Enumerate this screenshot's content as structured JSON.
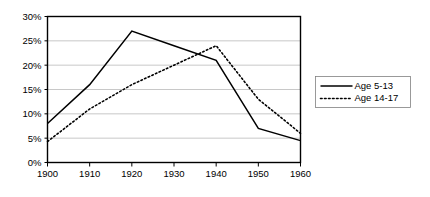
{
  "chart_data": {
    "type": "line",
    "title": "",
    "xlabel": "",
    "ylabel": "",
    "x": [
      1900,
      1910,
      1920,
      1930,
      1940,
      1950,
      1960
    ],
    "categories": [
      "1900",
      "1910",
      "1920",
      "1930",
      "1940",
      "1950",
      "1960"
    ],
    "series": [
      {
        "name": "Age 5-13",
        "style": "solid",
        "color": "#000000",
        "values": [
          8,
          16,
          27,
          24,
          21,
          7,
          4.5
        ]
      },
      {
        "name": "Age 14-17",
        "style": "dotted",
        "color": "#000000",
        "values": [
          4.3,
          11,
          16,
          20,
          24,
          13,
          6
        ]
      }
    ],
    "xlim": [
      1900,
      1960
    ],
    "ylim": [
      0,
      30
    ],
    "ytick_values": [
      0,
      5,
      10,
      15,
      20,
      25,
      30
    ],
    "ytick_labels": [
      "0%",
      "5%",
      "10%",
      "15%",
      "20%",
      "25%",
      "30%"
    ],
    "xtick_labels": [
      "1900",
      "1910",
      "1920",
      "1930",
      "1940",
      "1950",
      "1960"
    ],
    "grid": "horizontal",
    "legend_position": "right",
    "gridline_color": "#b0b0b0",
    "axis_color": "#000000",
    "background_color": "#ffffff"
  },
  "legend": {
    "entries": [
      {
        "label": "Age 5-13"
      },
      {
        "label": "Age 14-17"
      }
    ]
  }
}
